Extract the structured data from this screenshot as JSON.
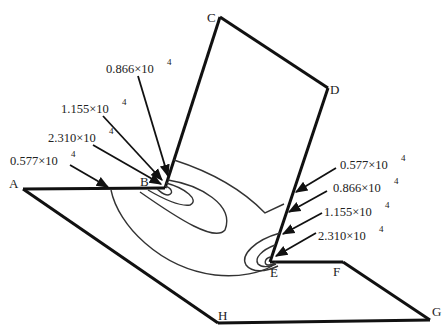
{
  "diagram": {
    "type": "stress-contour-on-folded-plate",
    "points": [
      {
        "id": "A",
        "label": "A"
      },
      {
        "id": "B",
        "label": "B"
      },
      {
        "id": "C",
        "label": "C"
      },
      {
        "id": "D",
        "label": "D"
      },
      {
        "id": "E",
        "label": "E"
      },
      {
        "id": "F",
        "label": "F"
      },
      {
        "id": "G",
        "label": "G"
      },
      {
        "id": "H",
        "label": "H"
      }
    ],
    "left_annotations": [
      {
        "mantissa": "0.866",
        "times": "×10",
        "exponent": "4"
      },
      {
        "mantissa": "1.155",
        "times": "×10",
        "exponent": "4"
      },
      {
        "mantissa": "2.310",
        "times": "×10",
        "exponent": "4"
      },
      {
        "mantissa": "0.577",
        "times": "×10",
        "exponent": "4"
      }
    ],
    "right_annotations": [
      {
        "mantissa": "0.577",
        "times": "×10",
        "exponent": "4"
      },
      {
        "mantissa": "0.866",
        "times": "×10",
        "exponent": "4"
      },
      {
        "mantissa": "1.155",
        "times": "×10",
        "exponent": "4"
      },
      {
        "mantissa": "2.310",
        "times": "×10",
        "exponent": "4"
      }
    ],
    "colors": {
      "line": "#111111",
      "contour": "#333333",
      "text": "#222222"
    }
  }
}
